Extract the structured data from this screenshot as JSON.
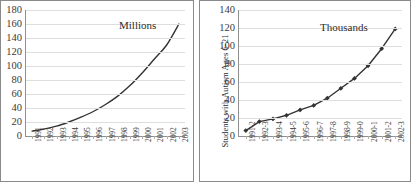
{
  "figure": {
    "background_color": "#ffffff",
    "line_color": "#333333",
    "grid_color": "#dedede",
    "axis_color": "#909090"
  },
  "chart_data": [
    {
      "id": "left",
      "type": "line",
      "title": "",
      "annotation": "Millions",
      "xlabel": "",
      "ylabel": "",
      "ylim": [
        0,
        180
      ],
      "yticks": [
        0,
        20,
        40,
        60,
        80,
        100,
        120,
        140,
        160,
        180
      ],
      "grid": true,
      "markers": false,
      "legend": "none",
      "categories": [
        "1991",
        "1992",
        "1993",
        "1994",
        "1995",
        "1996",
        "1997",
        "1998",
        "1999",
        "2000",
        "2001",
        "2002",
        "2003"
      ],
      "values": [
        7,
        10,
        14,
        20,
        27,
        35,
        45,
        57,
        72,
        90,
        110,
        130,
        160
      ]
    },
    {
      "id": "right",
      "type": "line",
      "title": "",
      "annotation": "Thousands",
      "xlabel": "",
      "ylabel": "Students with Autism Ages 6-21",
      "ylim": [
        0,
        140
      ],
      "yticks": [
        0,
        20,
        40,
        60,
        80,
        100,
        120,
        140
      ],
      "grid": true,
      "markers": true,
      "legend": "none",
      "categories": [
        "1991-2",
        "1992-3",
        "1993-4",
        "1994-5",
        "1995-6",
        "1996-7",
        "1997-8",
        "1998-9",
        "1999-0",
        "2000-1",
        "2001-2",
        "2002-3"
      ],
      "values": [
        6,
        16,
        19,
        23,
        29,
        34,
        42,
        53,
        64,
        78,
        97,
        119
      ]
    }
  ]
}
